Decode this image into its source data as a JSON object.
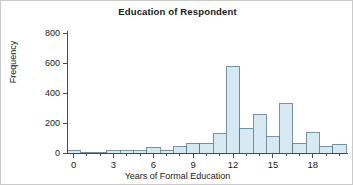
{
  "chart_data": {
    "type": "bar",
    "title": "Education of Respondent",
    "xlabel": "Years of Formal Education",
    "ylabel": "Frequency",
    "grid": false,
    "legend": "none",
    "bin_width": 1,
    "xlim": [
      -0.5,
      20.5
    ],
    "ylim": [
      0,
      800
    ],
    "xticks": [
      0,
      3,
      6,
      9,
      12,
      15,
      18
    ],
    "xtick_labels": [
      "0",
      "3",
      "6",
      "9",
      "12",
      "15",
      "18"
    ],
    "yticks": [
      0,
      200,
      400,
      600,
      800
    ],
    "ytick_labels": [
      "0",
      "200",
      "400",
      "600",
      "800"
    ],
    "categories": [
      0,
      1,
      2,
      3,
      4,
      5,
      6,
      7,
      8,
      9,
      10,
      11,
      12,
      13,
      14,
      15,
      16,
      17,
      18,
      19,
      20
    ],
    "values": [
      20,
      5,
      5,
      15,
      15,
      15,
      40,
      20,
      45,
      65,
      65,
      130,
      580,
      165,
      260,
      110,
      330,
      65,
      135,
      45,
      60
    ],
    "bar_fill_color": "#d6e8f2",
    "bar_edge_color": "#5a7a8c",
    "axis_color": "#4a4a4a",
    "background_color": "#ffffff",
    "text_color": "#1a1a1a"
  }
}
